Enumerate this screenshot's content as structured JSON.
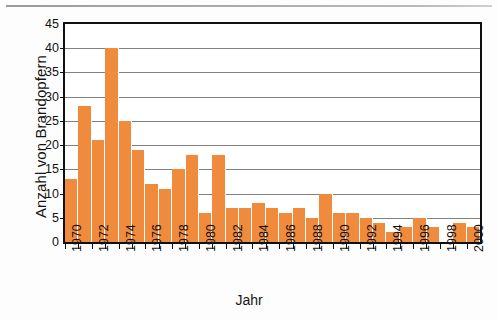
{
  "chart_data": {
    "type": "bar",
    "title": "",
    "xlabel": "Jahr",
    "ylabel": "Anzahl von Brandopfern",
    "grid": true,
    "legend": "none",
    "xlim": [
      1970,
      2000
    ],
    "ylim": [
      0,
      45
    ],
    "ytick_labels": [
      "0",
      "5",
      "10",
      "15",
      "20",
      "25",
      "30",
      "35",
      "40",
      "45"
    ],
    "ytick_values": [
      0,
      5,
      10,
      15,
      20,
      25,
      30,
      35,
      40,
      45
    ],
    "xtick_labels": [
      "1970",
      "1972",
      "1974",
      "1976",
      "1978",
      "1980",
      "1982",
      "1984",
      "1986",
      "1988",
      "1990",
      "1992",
      "1994",
      "1996",
      "1998",
      "2000"
    ],
    "xtick_values": [
      1970,
      1972,
      1974,
      1976,
      1978,
      1980,
      1982,
      1984,
      1986,
      1988,
      1990,
      1992,
      1994,
      1996,
      1998,
      2000
    ],
    "bar_color": "#f08a3c",
    "categories": [
      1970,
      1971,
      1972,
      1973,
      1974,
      1975,
      1976,
      1977,
      1978,
      1979,
      1980,
      1981,
      1982,
      1983,
      1984,
      1985,
      1986,
      1987,
      1988,
      1989,
      1990,
      1991,
      1992,
      1993,
      1994,
      1995,
      1996,
      1997,
      1998,
      1999,
      2000
    ],
    "values": [
      13,
      28,
      21,
      40,
      25,
      19,
      12,
      11,
      15,
      18,
      6,
      18,
      7,
      7,
      8,
      7,
      6,
      7,
      5,
      10,
      6,
      6,
      5,
      4,
      2,
      3,
      5,
      3,
      0,
      4,
      3
    ]
  }
}
